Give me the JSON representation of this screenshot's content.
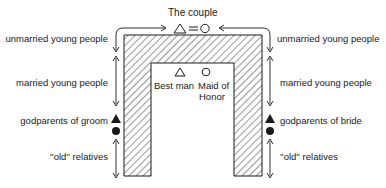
{
  "diagram": {
    "title": "The couple",
    "couple_symbols": {
      "groom": "△",
      "link": "=",
      "bride": "○"
    },
    "inner": {
      "best_man": {
        "symbol": "△",
        "label": "Best man"
      },
      "maid_of_honor": {
        "symbol": "○",
        "label_line1": "Maid of",
        "label_line2": "Honor"
      }
    },
    "left_side": {
      "labels": [
        "unmarried young people",
        "married young people",
        "godparents of groom",
        "''old'' relatives"
      ]
    },
    "right_side": {
      "labels": [
        "unmarried young people",
        "married young people",
        "godparents of bride",
        "''old'' relatives"
      ]
    },
    "legend_symbols": {
      "filled_triangle": "male godparent",
      "filled_circle": "female godparent"
    },
    "colors": {
      "ink": "#1a1a1a",
      "background": "#ffffff"
    }
  }
}
